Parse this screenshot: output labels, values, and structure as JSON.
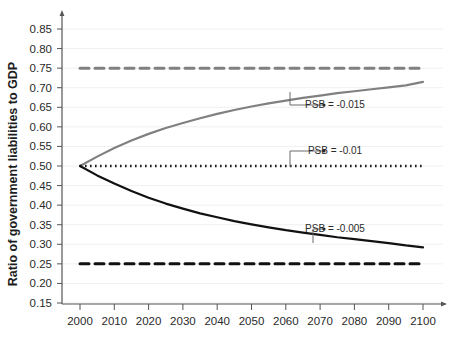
{
  "chart_data": {
    "type": "line",
    "title": "",
    "xlabel": "",
    "ylabel": "Ratio of government liabilities to GDP",
    "xlim": [
      2000,
      2100
    ],
    "ylim": [
      0.15,
      0.85
    ],
    "grid": true,
    "legend_position": "none",
    "x_ticks": [
      "2000",
      "2010",
      "2020",
      "2030",
      "2040",
      "2050",
      "2060",
      "2070",
      "2080",
      "2090",
      "2100"
    ],
    "y_ticks": [
      "0.15",
      "0.20",
      "0.25",
      "0.30",
      "0.35",
      "0.40",
      "0.45",
      "0.50",
      "0.55",
      "0.60",
      "0.65",
      "0.70",
      "0.75",
      "0.80",
      "0.85"
    ],
    "x": [
      2000,
      2005,
      2010,
      2015,
      2020,
      2025,
      2030,
      2035,
      2040,
      2045,
      2050,
      2055,
      2060,
      2065,
      2070,
      2075,
      2080,
      2085,
      2090,
      2095,
      2100
    ],
    "series": [
      {
        "name": "PSB = -0.015",
        "color": "#808080",
        "style": "solid",
        "values": [
          0.5,
          0.524,
          0.546,
          0.565,
          0.582,
          0.597,
          0.61,
          0.622,
          0.633,
          0.643,
          0.652,
          0.66,
          0.667,
          0.674,
          0.68,
          0.686,
          0.691,
          0.696,
          0.701,
          0.706,
          0.715
        ]
      },
      {
        "name": "PSB = -0.015 steady state",
        "color": "#808080",
        "style": "dashed",
        "values": [
          0.75,
          0.75,
          0.75,
          0.75,
          0.75,
          0.75,
          0.75,
          0.75,
          0.75,
          0.75,
          0.75,
          0.75,
          0.75,
          0.75,
          0.75,
          0.75,
          0.75,
          0.75,
          0.75,
          0.75,
          0.75
        ]
      },
      {
        "name": "PSB = -0.01",
        "color": "#1a1a1a",
        "style": "dotted",
        "values": [
          0.5,
          0.5,
          0.5,
          0.5,
          0.5,
          0.5,
          0.5,
          0.5,
          0.5,
          0.5,
          0.5,
          0.5,
          0.5,
          0.5,
          0.5,
          0.5,
          0.5,
          0.5,
          0.5,
          0.5,
          0.5
        ]
      },
      {
        "name": "PSB = -0.005",
        "color": "#111111",
        "style": "solid",
        "values": [
          0.5,
          0.476,
          0.455,
          0.436,
          0.419,
          0.404,
          0.391,
          0.379,
          0.369,
          0.359,
          0.351,
          0.343,
          0.336,
          0.33,
          0.324,
          0.318,
          0.313,
          0.308,
          0.303,
          0.297,
          0.292
        ]
      },
      {
        "name": "PSB = -0.005 steady state",
        "color": "#111111",
        "style": "dashed",
        "values": [
          0.25,
          0.25,
          0.25,
          0.25,
          0.25,
          0.25,
          0.25,
          0.25,
          0.25,
          0.25,
          0.25,
          0.25,
          0.25,
          0.25,
          0.25,
          0.25,
          0.25,
          0.25,
          0.25,
          0.25,
          0.25
        ]
      }
    ],
    "annotations": [
      {
        "id": "annot-psb-015",
        "text": "PSB = -0.015",
        "text_x": 335,
        "text_y": 108,
        "anchor_x": 290,
        "anchor_y": 92,
        "elbow_x": 290,
        "elbow_y": 105,
        "dot_x": 324,
        "dot_y": 105
      },
      {
        "id": "annot-psb-01",
        "text": "PSB = -0.01",
        "text_x": 335,
        "text_y": 154,
        "anchor_x": 290,
        "anchor_y": 167,
        "elbow_x": 290,
        "elbow_y": 151,
        "dot_x": 324,
        "dot_y": 151
      },
      {
        "id": "annot-psb-005",
        "text": "PSB = -0.005",
        "text_x": 335,
        "text_y": 232,
        "anchor_x": 313,
        "anchor_y": 243,
        "elbow_x": 313,
        "elbow_y": 229,
        "dot_x": 324,
        "dot_y": 229
      }
    ]
  }
}
